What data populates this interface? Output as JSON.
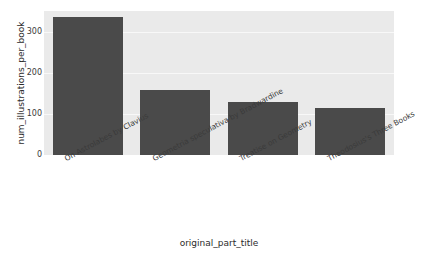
{
  "chart_data": {
    "type": "bar",
    "title": "",
    "xlabel": "original_part_title",
    "ylabel": "num_illustrations_per_book",
    "categories": [
      "On Astrolabes by Clavius",
      "Geometria speculativa by Bradwardine",
      "Treatise on Geometry",
      "Theodosius's Three Books"
    ],
    "values": [
      338,
      159,
      130,
      114
    ],
    "ylim": [
      0,
      352
    ],
    "yticks": [
      0,
      100,
      200,
      300
    ],
    "ytick_labels": [
      "0",
      "100",
      "200",
      "300"
    ],
    "grid": true,
    "legend": null,
    "colors": {
      "bar": "#4a4a4a",
      "plot_background": "#eaeaea",
      "gridline": "#f8f8f8",
      "figure_background": "#ffffff",
      "text": "#3a3a3a"
    }
  }
}
